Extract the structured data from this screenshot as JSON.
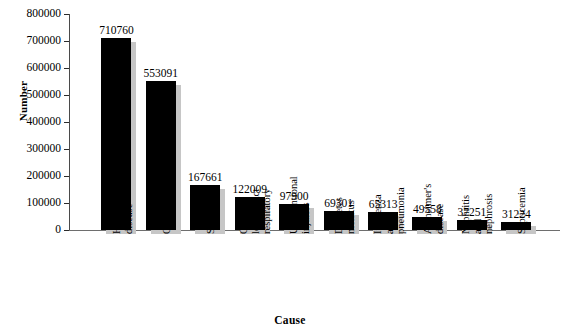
{
  "chart_data": {
    "type": "bar",
    "title": "",
    "xlabel": "Cause",
    "ylabel": "Number",
    "ylim": [
      0,
      800000
    ],
    "ytick_labels": [
      "800000",
      "700000",
      "600000",
      "500000",
      "400000",
      "300000",
      "200000",
      "100000",
      "0"
    ],
    "ytick_values": [
      800000,
      700000,
      600000,
      500000,
      400000,
      300000,
      200000,
      100000,
      0
    ],
    "grid": false,
    "legend": "none",
    "bar_color": "#000000",
    "shadow_color": "#c6c6c6",
    "background_color": "#ffffff",
    "categories": [
      "Heart disease",
      "Cancer",
      "Stroke",
      "Chronic lower tract respiratory",
      "Unintentional injuries",
      "Diabetes mellitus",
      "Influenza and pneumonia",
      "Alzheimer's disease",
      "Nephritis and nephrosis",
      "Septicemia"
    ],
    "values": [
      710760,
      553091,
      167661,
      122009,
      97900,
      69301,
      65313,
      49558,
      37251,
      31224
    ],
    "data_labels": [
      "710760",
      "553091",
      "167661",
      "122009",
      "97900",
      "69301",
      "65313",
      "49558",
      "37251",
      "31224"
    ],
    "category_label_lines": [
      [
        "Heart",
        "disease"
      ],
      [
        "Cancer"
      ],
      [
        "Stroke"
      ],
      [
        "Chronic",
        "lower tract",
        "respiratory"
      ],
      [
        "Unintentional",
        "injuries"
      ],
      [
        "Diabetes",
        "mellitus"
      ],
      [
        "Influenza",
        "and",
        "pneumonia"
      ],
      [
        "Alzheimer's",
        "disease"
      ],
      [
        "Nephritis",
        "and",
        "nephrosis"
      ],
      [
        "Septicemia"
      ]
    ]
  }
}
